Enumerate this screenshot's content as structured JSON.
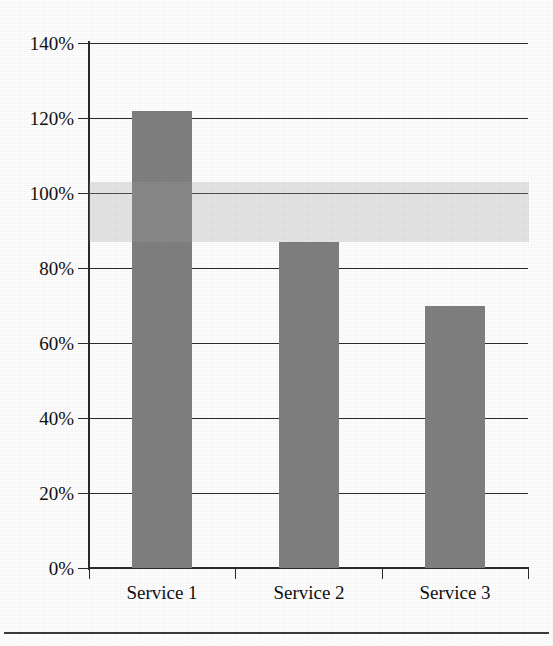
{
  "chart_data": {
    "type": "bar",
    "title": "",
    "subtitle": "",
    "xlabel": "",
    "ylabel": "",
    "categories": [
      "Service 1",
      "Service 2",
      "Service 3"
    ],
    "values": [
      122,
      87,
      70
    ],
    "value_labels": [
      "122%",
      "87%",
      "70%"
    ],
    "series": [
      {
        "name": "",
        "values": [
          122,
          87,
          70
        ]
      }
    ],
    "ylim": [
      0,
      140
    ],
    "ytick_values": [
      0,
      20,
      40,
      60,
      80,
      100,
      120,
      140
    ],
    "ytick_labels": [
      "0%",
      "20%",
      "40%",
      "60%",
      "80%",
      "100%",
      "120%",
      "140%"
    ],
    "grid": true,
    "grid_axis": "y",
    "legend": false,
    "legend_position": "none",
    "annotations": [
      {
        "type": "horizontal-band",
        "label": "",
        "y_start": 87,
        "y_end": 103,
        "color": "#ebebeb"
      }
    ],
    "colors": {
      "bar": "#808080",
      "bar_highlighted": "#9b9b9b",
      "band": "#ebebeb",
      "axis": "#2b2b2b",
      "gridline": "#2b2b2b",
      "text": "#111111",
      "background": "#ffffff"
    }
  },
  "axis": {
    "y_ticks": [
      {
        "label": "140%",
        "value": 140
      },
      {
        "label": "120%",
        "value": 120
      },
      {
        "label": "100%",
        "value": 100
      },
      {
        "label": "80%",
        "value": 80
      },
      {
        "label": "60%",
        "value": 60
      },
      {
        "label": "40%",
        "value": 40
      },
      {
        "label": "20%",
        "value": 20
      },
      {
        "label": "0%",
        "value": 0
      }
    ],
    "x_categories": [
      {
        "label": "Service 1"
      },
      {
        "label": "Service 2"
      },
      {
        "label": "Service 3"
      }
    ]
  }
}
